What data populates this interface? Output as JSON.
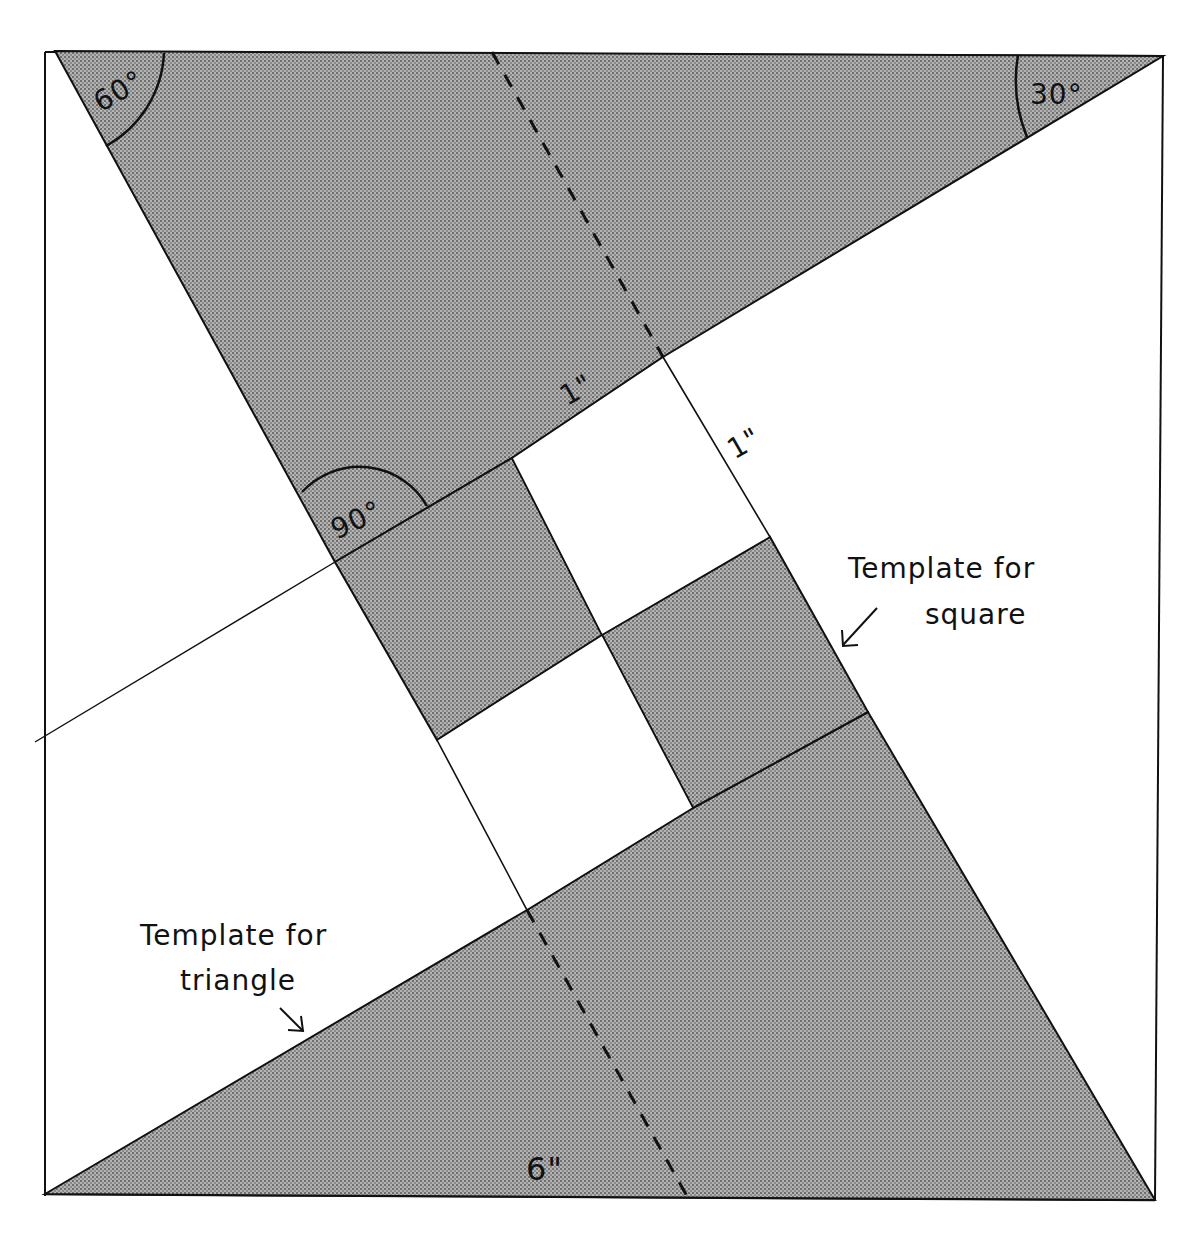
{
  "diagram": {
    "colors": {
      "background": "#ffffff",
      "line": "#111111",
      "shade": "#9a9a9a",
      "shade_dot": "#5a5a5a"
    },
    "angles": {
      "top_left": "60°",
      "top_right": "30°",
      "right_angle": "90°"
    },
    "dimensions": {
      "short_side": "1\"",
      "square_side": "1\"",
      "long_side": "6\""
    },
    "annotations": {
      "square_line1": "Template for",
      "square_line2": "square",
      "triangle_line1": "Template for",
      "triangle_line2": "triangle"
    }
  }
}
